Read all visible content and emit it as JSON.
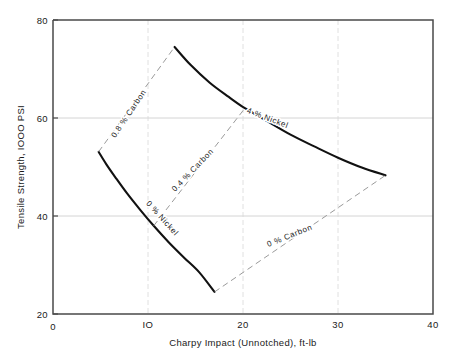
{
  "chart_data": {
    "type": "line",
    "title": "",
    "xlabel": "Charpy Impact (Unnotched), ft-lb",
    "ylabel": "Tensile Strength, IOOO PSI",
    "xlim": [
      0,
      40
    ],
    "ylim": [
      20,
      80
    ],
    "xticks": [
      "0",
      "IO",
      "20",
      "30",
      "40"
    ],
    "xtick_values": [
      0,
      10,
      20,
      30,
      40
    ],
    "yticks": [
      "20",
      "40",
      "60",
      "80"
    ],
    "ytick_values": [
      20,
      40,
      60,
      80
    ],
    "grid": "horizontal gridlines at 40 and 60; faint vertical gridlines at 10, 20, 30",
    "legend": "inline curve labels",
    "series": [
      {
        "name": "4 % Nickel",
        "style": "solid",
        "label": "4 % Nickel",
        "label_x": 22.5,
        "label_y": 59.5,
        "label_rotation": 21,
        "points": [
          [
            12.8,
            74.5
          ],
          [
            14.5,
            70.8
          ],
          [
            16.5,
            67.2
          ],
          [
            18.5,
            64.3
          ],
          [
            20.2,
            62.0
          ],
          [
            22.5,
            59.4
          ],
          [
            25.0,
            56.6
          ],
          [
            27.5,
            54.2
          ],
          [
            30.0,
            51.9
          ],
          [
            32.5,
            49.9
          ],
          [
            35.0,
            48.3
          ]
        ]
      },
      {
        "name": "0 % Nickel",
        "style": "solid",
        "label": "0 % Nickel",
        "label_x": 11.3,
        "label_y": 39.2,
        "label_rotation": 48,
        "points": [
          [
            4.8,
            53.1
          ],
          [
            5.6,
            50.6
          ],
          [
            6.6,
            47.8
          ],
          [
            7.8,
            44.6
          ],
          [
            9.2,
            41.2
          ],
          [
            10.6,
            38.0
          ],
          [
            12.2,
            34.6
          ],
          [
            13.8,
            31.5
          ],
          [
            15.4,
            28.5
          ],
          [
            17.0,
            24.5
          ]
        ]
      },
      {
        "name": "0.8 % Carbon",
        "style": "dashed",
        "label": "0.8 % Carbon",
        "label_x": 8.2,
        "label_y": 60.6,
        "label_rotation": -56,
        "points": [
          [
            4.8,
            53.1
          ],
          [
            12.8,
            74.5
          ]
        ]
      },
      {
        "name": "0.4 % Carbon",
        "style": "dashed",
        "label": "0.4 % Carbon",
        "label_x": 14.9,
        "label_y": 49.0,
        "label_rotation": -46,
        "points": [
          [
            10.6,
            38.0
          ],
          [
            20.2,
            62.0
          ]
        ]
      },
      {
        "name": "0 % Carbon",
        "style": "dashed",
        "label": "0 % Carbon",
        "label_x": 25.0,
        "label_y": 35.5,
        "label_rotation": -22,
        "points": [
          [
            17.0,
            24.5
          ],
          [
            35.0,
            48.3
          ]
        ]
      }
    ]
  },
  "colors": {
    "solid_curve": "#111111",
    "dashed_curve": "#8f8f8f",
    "frame": "#4a4a4a",
    "gridline": "#c9c9c9",
    "text": "#1a1a1a",
    "background": "#ffffff"
  }
}
